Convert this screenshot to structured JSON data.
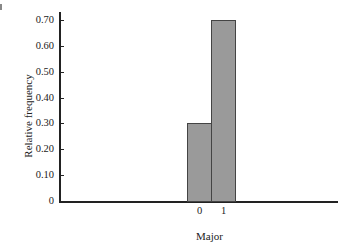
{
  "chart_data": {
    "type": "bar",
    "title": "",
    "xlabel": "Major",
    "ylabel": "Relative frequency",
    "categories": [
      "0",
      "1"
    ],
    "values": [
      0.3,
      0.7
    ],
    "ylim": [
      0,
      0.7
    ],
    "yticks": [
      "0",
      "0.10",
      "0.20",
      "0.30",
      "0.40",
      "0.50",
      "0.60",
      "0.70"
    ],
    "grid": false,
    "legend": null,
    "bar_color": "#9a9a9a"
  }
}
